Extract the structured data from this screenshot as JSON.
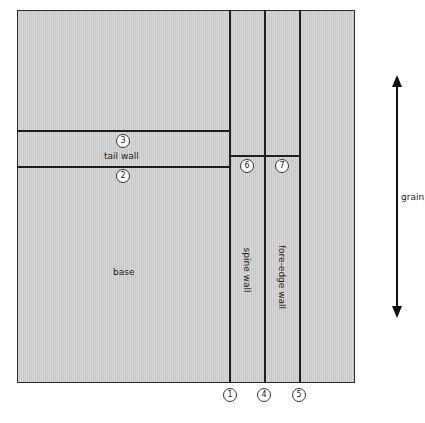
{
  "diagram": {
    "regions": {
      "tail_wall": "tail wall",
      "base": "base",
      "spine_wall": "spine wall",
      "fore_edge_wall": "fore-edge wall"
    },
    "markers": {
      "m1": "1",
      "m2": "2",
      "m3": "3",
      "m4": "4",
      "m5": "5",
      "m6": "6",
      "m7": "7"
    },
    "grain_label": "grain",
    "colors": {
      "board_fill": "#cfcfcf",
      "line": "#1e1e1e",
      "background": "#ffffff"
    }
  }
}
